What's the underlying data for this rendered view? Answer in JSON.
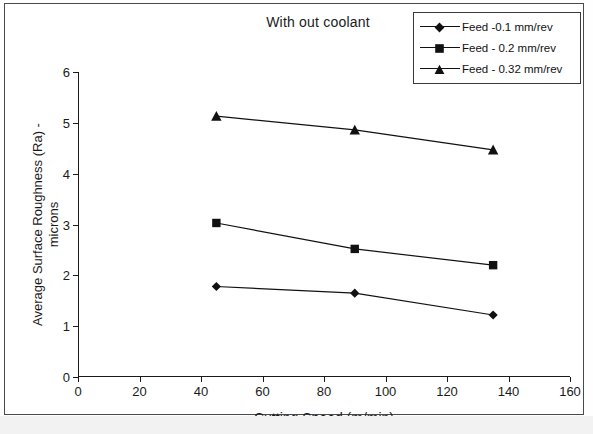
{
  "chart_data": {
    "type": "line",
    "title": "With out coolant",
    "xlabel": "Cutting Speed (m/min)",
    "ylabel": "Average Surface Roughness (Ra) - microns",
    "ylabel_line1": "Average Surface Roughness (Ra) -",
    "ylabel_line2": "microns",
    "x": [
      45,
      90,
      135
    ],
    "xlim": [
      0,
      160
    ],
    "ylim": [
      0,
      6
    ],
    "xticks": [
      0,
      20,
      40,
      60,
      80,
      100,
      120,
      140,
      160
    ],
    "yticks": [
      0,
      1,
      2,
      3,
      4,
      5,
      6
    ],
    "grid": false,
    "legend_position": "top-right",
    "series": [
      {
        "name": "Feed -0.1 mm/rev",
        "marker": "diamond",
        "color": "#111111",
        "values": [
          1.78,
          1.65,
          1.22
        ]
      },
      {
        "name": "Feed - 0.2 mm/rev",
        "marker": "square",
        "color": "#111111",
        "values": [
          3.03,
          2.52,
          2.2
        ]
      },
      {
        "name": "Feed - 0.32 mm/rev",
        "marker": "triangle",
        "color": "#111111",
        "values": [
          5.13,
          4.86,
          4.47
        ]
      }
    ]
  },
  "legend": {
    "items": [
      {
        "label": "Feed -0.1 mm/rev",
        "marker": "diamond"
      },
      {
        "label": "Feed - 0.2 mm/rev",
        "marker": "square"
      },
      {
        "label": "Feed - 0.32 mm/rev",
        "marker": "triangle"
      }
    ]
  }
}
